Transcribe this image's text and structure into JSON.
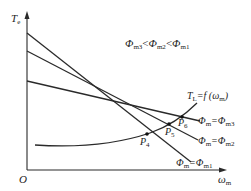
{
  "diagram": {
    "axes": {
      "y_label_main": "T",
      "y_label_sub": "e",
      "x_label_main": "ω",
      "x_label_sub": "m",
      "origin": "O"
    },
    "relation": {
      "text_a": "Φ",
      "sub_a": "m3",
      "lt1": "<",
      "text_b": "Φ",
      "sub_b": "m2",
      "lt2": "<",
      "text_c": "Φ",
      "sub_c": "m1"
    },
    "load_curve": {
      "label_main": "T",
      "label_sub": "L",
      "label_rest": "=f (ω",
      "label_sub2": "m",
      "label_end": ")"
    },
    "lines": [
      {
        "label_pre": "Φ",
        "label_sub1": "m",
        "label_eq": "=Φ",
        "label_sub2": "m3"
      },
      {
        "label_pre": "Φ",
        "label_sub1": "m",
        "label_eq": "=Φ",
        "label_sub2": "m2"
      },
      {
        "label_pre": "Φ",
        "label_sub1": "m",
        "label_eq": "=Φ",
        "label_sub2": "m1"
      }
    ],
    "points": [
      {
        "main": "P",
        "sub": "4"
      },
      {
        "main": "P",
        "sub": "5"
      },
      {
        "main": "P",
        "sub": "6"
      }
    ],
    "stroke_color": "#2a2a2a"
  }
}
